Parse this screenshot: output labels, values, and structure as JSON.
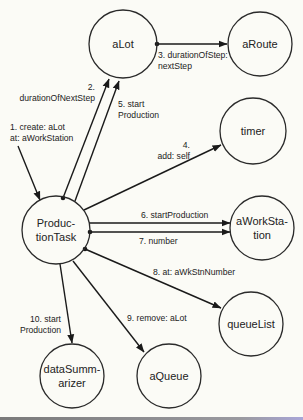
{
  "diagram": {
    "title": "",
    "nodes": [
      {
        "id": "aLot",
        "lines": [
          "aLot"
        ],
        "cx": 123,
        "cy": 44,
        "r": 34
      },
      {
        "id": "aRoute",
        "lines": [
          "aRoute"
        ],
        "cx": 260,
        "cy": 44,
        "r": 32
      },
      {
        "id": "timer",
        "lines": [
          "timer"
        ],
        "cx": 253,
        "cy": 131,
        "r": 33
      },
      {
        "id": "ProductionTask",
        "lines": [
          "Produc-",
          "tionTask"
        ],
        "cx": 56,
        "cy": 230,
        "r": 34
      },
      {
        "id": "aWorkStation",
        "lines": [
          "aWorkSta-",
          "tion"
        ],
        "cx": 262,
        "cy": 228,
        "r": 32
      },
      {
        "id": "queueList",
        "lines": [
          "queueList"
        ],
        "cx": 251,
        "cy": 324,
        "r": 32
      },
      {
        "id": "dataSummarizer",
        "lines": [
          "dataSumm-",
          "arizer"
        ],
        "cx": 72,
        "cy": 376,
        "r": 32
      },
      {
        "id": "aQueue",
        "lines": [
          "aQueue"
        ],
        "cx": 169,
        "cy": 376,
        "r": 32
      }
    ],
    "edges": [
      {
        "id": "e1",
        "from": "external",
        "to": "ProductionTask",
        "label_lines": [
          "1. create: aLot",
          "at: aWorkStation"
        ],
        "x1": 18,
        "y1": 146,
        "x2": 40,
        "y2": 200,
        "dot": false
      },
      {
        "id": "e2",
        "from": "ProductionTask",
        "to": "aLot",
        "label_lines": [
          "2.",
          "durationOfNextStep"
        ],
        "x1": 63,
        "y1": 198,
        "x2": 109,
        "y2": 79,
        "dot": true
      },
      {
        "id": "e3",
        "from": "aLot",
        "to": "aRoute",
        "label_lines": [
          "3. durationOfStep:",
          "nextStep"
        ],
        "x1": 157,
        "y1": 44,
        "x2": 227,
        "y2": 44,
        "dot": true
      },
      {
        "id": "e4",
        "from": "ProductionTask",
        "to": "timer",
        "label_lines": [
          "4.",
          "add: self"
        ],
        "x1": 84,
        "y1": 210,
        "x2": 221,
        "y2": 145,
        "dot": false
      },
      {
        "id": "e5",
        "from": "ProductionTask",
        "to": "aLot",
        "label_lines": [
          "5. start",
          "Production"
        ],
        "x1": 75,
        "y1": 201,
        "x2": 119,
        "y2": 81,
        "dot": false
      },
      {
        "id": "e6",
        "from": "ProductionTask",
        "to": "aWorkStation",
        "label_lines": [
          "6. startProduction"
        ],
        "x1": 89,
        "y1": 223,
        "x2": 230,
        "y2": 223,
        "dot": false
      },
      {
        "id": "e7",
        "from": "ProductionTask",
        "to": "aWorkStation",
        "label_lines": [
          "7. number"
        ],
        "x1": 90,
        "y1": 232,
        "x2": 230,
        "y2": 232,
        "dot": true
      },
      {
        "id": "e8",
        "from": "ProductionTask",
        "to": "queueList",
        "label_lines": [
          "8. at: aWkStnNumber"
        ],
        "x1": 85,
        "y1": 249,
        "x2": 221,
        "y2": 308,
        "dot": true
      },
      {
        "id": "e9",
        "from": "ProductionTask",
        "to": "aQueue",
        "label_lines": [
          "9. remove: aLot"
        ],
        "x1": 73,
        "y1": 261,
        "x2": 144,
        "y2": 352,
        "dot": false
      },
      {
        "id": "e10",
        "from": "ProductionTask",
        "to": "dataSummarizer",
        "label_lines": [
          "10. start",
          "Production"
        ],
        "x1": 60,
        "y1": 264,
        "x2": 72,
        "y2": 343,
        "dot": false
      }
    ],
    "labels": {
      "e1": {
        "x": 10,
        "y": 130,
        "anchor": "start"
      },
      "e2": {
        "x": 95,
        "y": 90,
        "anchor": "end",
        "line2_x": 95
      },
      "e3": {
        "x": 158,
        "y": 58,
        "anchor": "start"
      },
      "e4": {
        "x": 190,
        "y": 148,
        "anchor": "end"
      },
      "e5": {
        "x": 118,
        "y": 107,
        "anchor": "start"
      },
      "e6": {
        "x": 141,
        "y": 218,
        "anchor": "start"
      },
      "e7": {
        "x": 139,
        "y": 244,
        "anchor": "start"
      },
      "e8": {
        "x": 153,
        "y": 275,
        "anchor": "start"
      },
      "e9": {
        "x": 127,
        "y": 321,
        "anchor": "start"
      },
      "e10": {
        "x": 61,
        "y": 322,
        "anchor": "end"
      }
    },
    "colors": {
      "background": "#fbfbf6",
      "stroke": "#1a1a1a",
      "text": "#222222"
    }
  }
}
